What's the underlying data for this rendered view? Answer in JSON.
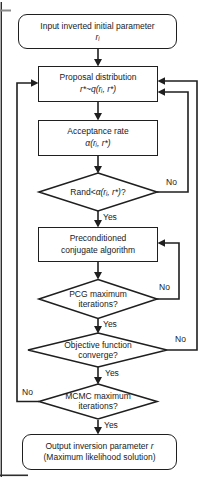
{
  "colors": {
    "ink": "#1f1f1f",
    "background": "#ffffff"
  },
  "nodes": {
    "input": {
      "line1": "Input inverted initial parameter",
      "formula": "rᵢ"
    },
    "proposal": {
      "line1": "Proposal distribution",
      "formula": "r*~q(rᵢ, r*)"
    },
    "acceptance": {
      "line1": "Acceptance rate",
      "formula": "α(rᵢ, r*)"
    },
    "rand": {
      "prefix": "Rand<",
      "formula": "α(rᵢ, r*)",
      "suffix": "?"
    },
    "precond": {
      "line1": "Preconditioned",
      "line2": "conjugate algorithm"
    },
    "pcg": {
      "line1": "PCG maximum",
      "line2": "iterations?"
    },
    "objective": {
      "line1": "Objective function",
      "line2": "converge?"
    },
    "mcmc": {
      "line1": "MCMC maximum",
      "line2": "iterations?"
    },
    "output": {
      "line1": "Output inversion parameter",
      "param": "r",
      "line2": "(Maximum likelihood solution)"
    }
  },
  "labels": {
    "yes": "Yes",
    "no": "No"
  }
}
